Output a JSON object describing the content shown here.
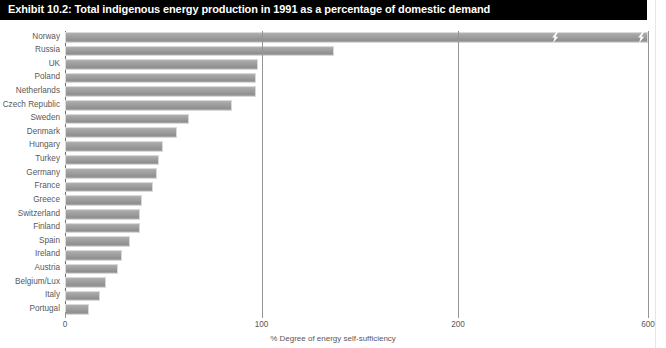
{
  "title": "Exhibit 10.2: Total indigenous energy production in 1991 as a percentage of domestic demand",
  "colors": {
    "title_bar_background": "#000000",
    "title_text": "#ffffff",
    "bar_fill": "#9b9b9b",
    "bar_edge": "#d9d9d9",
    "axis": "#939598",
    "label_text": "#58595b"
  },
  "chart_data": {
    "type": "bar",
    "orientation": "horizontal",
    "title": "Exhibit 10.2: Total indigenous energy production in 1991 as a percentage of domestic demand",
    "xlabel": "% Degree of energy self-sufficiency",
    "ylabel": "",
    "grid": true,
    "legend": false,
    "axis_break": true,
    "axis_break_note": "Axis is broken between 200 and 600; Norway's bar carries two zigzag break marks",
    "xlim": [
      0,
      600
    ],
    "xticks": [
      0,
      100,
      200,
      600
    ],
    "xtick_labels": [
      "0",
      "100",
      "200",
      "600"
    ],
    "categories": [
      "Norway",
      "Russia",
      "UK",
      "Poland",
      "Netherlands",
      "Czech Republic",
      "Sweden",
      "Denmark",
      "Hungary",
      "Turkey",
      "Germany",
      "France",
      "Greece",
      "Switzerland",
      "Finland",
      "Spain",
      "Ireland",
      "Austria",
      "Belgium/Lux",
      "Italy",
      "Portugal"
    ],
    "values": [
      600,
      137,
      98,
      97,
      97,
      85,
      63,
      57,
      50,
      48,
      47,
      45,
      39,
      38,
      38,
      33,
      29,
      27,
      21,
      18,
      12
    ]
  }
}
